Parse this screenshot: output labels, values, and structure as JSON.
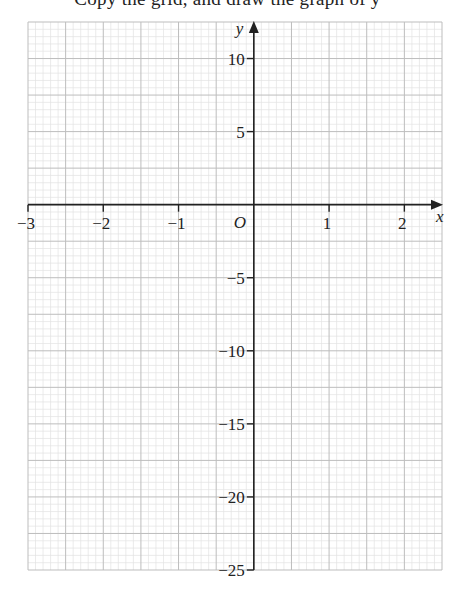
{
  "header": {
    "cut_off_text": "Copy the grid, and draw the graph of y"
  },
  "chart_data": {
    "type": "line",
    "title": "",
    "xlabel": "x",
    "ylabel": "y",
    "origin_label": "O",
    "xlim": [
      -3,
      2.5
    ],
    "ylim": [
      -25,
      12.5
    ],
    "x_ticks": [
      -3,
      -2,
      -1,
      1,
      2
    ],
    "x_tick_labels": [
      "−3",
      "−2",
      "−1",
      "1",
      "2"
    ],
    "y_ticks": [
      10,
      5,
      -5,
      -10,
      -15,
      -20,
      -25
    ],
    "y_tick_labels": [
      "10",
      "5",
      "−5",
      "−10",
      "−15",
      "−20",
      "−25"
    ],
    "grid": true,
    "grid_major_x_step": 0.5,
    "grid_major_y_step": 2.5,
    "grid_minor_subdivisions": 5,
    "series": []
  },
  "colors": {
    "axis": "#222222",
    "grid_major": "#bdbdbd",
    "grid_minor": "#e2e2e2",
    "text": "#222222"
  }
}
